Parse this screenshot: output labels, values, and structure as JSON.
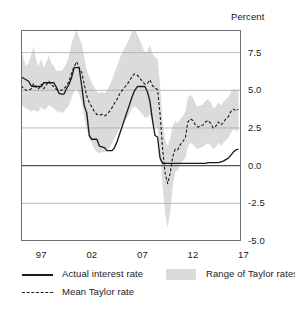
{
  "axis_title": "Percent",
  "legend": {
    "actual_label": "Actual interest rate",
    "mean_label": "Mean Taylor rate",
    "range_label": "Range of Taylor rates"
  },
  "colors": {
    "line": "#1a1a1a",
    "band": "#dbdbdb",
    "grid": "#aaaaaa",
    "zero_line": "#555555",
    "frame": "#6f6f6f"
  },
  "chart_data": {
    "type": "line",
    "title": "",
    "subtitle": "",
    "xlabel": "",
    "ylabel": "Percent",
    "xlim": [
      1995.0,
      2016.75
    ],
    "ylim": [
      -5.0,
      9.0
    ],
    "yticks": [
      7.5,
      5.0,
      2.5,
      0.0,
      -2.5,
      -5.0
    ],
    "ytick_labels": [
      "7.5",
      "5.0",
      "2.5",
      "0.0",
      "-2.5",
      "-5.0"
    ],
    "xticks": [
      1997,
      2002,
      2007,
      2012,
      2017
    ],
    "xtick_labels": [
      "97",
      "02",
      "07",
      "12",
      "17"
    ],
    "x_minor_ticks": [
      1996,
      1998,
      1999,
      2000,
      2001,
      2003,
      2004,
      2005,
      2006,
      2008,
      2009,
      2010,
      2011,
      2013,
      2014,
      2015,
      2016
    ],
    "grid": true,
    "grid_axis": "y",
    "zero_line": true,
    "legend_position": "below",
    "x": [
      1995.0,
      1995.25,
      1995.5,
      1995.75,
      1996.0,
      1996.25,
      1996.5,
      1996.75,
      1997.0,
      1997.25,
      1997.5,
      1997.75,
      1998.0,
      1998.25,
      1998.5,
      1998.75,
      1999.0,
      1999.25,
      1999.5,
      1999.75,
      2000.0,
      2000.25,
      2000.5,
      2000.75,
      2001.0,
      2001.25,
      2001.5,
      2001.75,
      2002.0,
      2002.25,
      2002.5,
      2002.75,
      2003.0,
      2003.25,
      2003.5,
      2003.75,
      2004.0,
      2004.25,
      2004.5,
      2004.75,
      2005.0,
      2005.25,
      2005.5,
      2005.75,
      2006.0,
      2006.25,
      2006.5,
      2006.75,
      2007.0,
      2007.25,
      2007.5,
      2007.75,
      2008.0,
      2008.25,
      2008.5,
      2008.75,
      2009.0,
      2009.25,
      2009.5,
      2009.75,
      2010.0,
      2010.25,
      2010.5,
      2010.75,
      2011.0,
      2011.25,
      2011.5,
      2011.75,
      2012.0,
      2012.25,
      2012.5,
      2012.75,
      2013.0,
      2013.25,
      2013.5,
      2013.75,
      2014.0,
      2014.25,
      2014.5,
      2014.75,
      2015.0,
      2015.25,
      2015.5,
      2015.75,
      2016.0,
      2016.25,
      2016.5
    ],
    "series": [
      {
        "name": "Actual interest rate",
        "style": "solid",
        "values": [
          5.9,
          5.8,
          5.7,
          5.6,
          5.3,
          5.25,
          5.25,
          5.25,
          5.25,
          5.5,
          5.5,
          5.5,
          5.5,
          5.5,
          5.2,
          4.8,
          4.75,
          4.75,
          5.1,
          5.4,
          5.85,
          6.5,
          6.5,
          6.5,
          5.3,
          4.0,
          3.5,
          2.0,
          1.75,
          1.75,
          1.75,
          1.3,
          1.25,
          1.2,
          1.0,
          1.0,
          1.0,
          1.2,
          1.6,
          2.1,
          2.6,
          3.1,
          3.6,
          4.1,
          4.6,
          5.0,
          5.25,
          5.25,
          5.25,
          5.25,
          4.9,
          4.25,
          3.0,
          2.0,
          1.9,
          0.5,
          0.15,
          0.15,
          0.15,
          0.15,
          0.15,
          0.15,
          0.15,
          0.15,
          0.15,
          0.15,
          0.15,
          0.15,
          0.15,
          0.15,
          0.15,
          0.15,
          0.15,
          0.15,
          0.2,
          0.2,
          0.2,
          0.2,
          0.2,
          0.25,
          0.3,
          0.4,
          0.5,
          0.7,
          0.9,
          1.05,
          1.1
        ],
        "description": "Federal funds rate path: near 5.25 in mid 1990s, peak 6.5 in 2000, trough 1.0 in 2003-04, peak 5.25 in 2006-07, near zero 2009-2015, rising to about 1.1 by 2016"
      },
      {
        "name": "Mean Taylor rate",
        "style": "dashed",
        "values": [
          5.3,
          5.15,
          5.0,
          5.0,
          5.1,
          5.45,
          5.2,
          5.1,
          5.4,
          5.1,
          5.35,
          5.6,
          5.35,
          5.25,
          5.05,
          5.0,
          5.0,
          5.1,
          5.3,
          5.6,
          6.15,
          6.55,
          6.9,
          6.5,
          6.2,
          5.4,
          4.6,
          4.2,
          3.9,
          3.6,
          3.4,
          3.35,
          3.4,
          3.3,
          3.4,
          3.6,
          3.85,
          4.15,
          4.4,
          4.75,
          5.0,
          5.2,
          5.4,
          5.65,
          5.95,
          6.1,
          6.0,
          5.8,
          5.6,
          5.4,
          5.45,
          5.7,
          5.3,
          5.15,
          5.05,
          3.4,
          1.1,
          -0.5,
          -1.2,
          -0.5,
          0.6,
          1.1,
          1.05,
          1.4,
          1.6,
          1.85,
          2.9,
          3.1,
          3.0,
          2.7,
          2.55,
          2.65,
          2.7,
          2.9,
          3.0,
          2.8,
          2.5,
          2.6,
          2.9,
          2.7,
          2.85,
          3.1,
          3.25,
          3.6,
          3.75,
          3.65,
          3.75
        ],
        "description": "Mean of Taylor rule prescriptions; peaks near 6.9 in 2000 and 6.1 in 2006, dips to about -1.2 in late 2009, recovering to about 3.75 by 2016"
      }
    ],
    "band": {
      "name": "Range of Taylor rates",
      "type": "range",
      "lower": [
        4.1,
        3.9,
        3.8,
        3.7,
        3.6,
        3.7,
        3.6,
        3.6,
        3.9,
        3.7,
        3.8,
        4.0,
        3.9,
        3.8,
        3.6,
        3.6,
        3.5,
        3.6,
        3.8,
        4.0,
        4.5,
        4.9,
        5.1,
        4.7,
        4.2,
        3.2,
        2.4,
        1.8,
        1.5,
        1.1,
        0.9,
        0.8,
        0.9,
        0.85,
        0.95,
        1.15,
        1.5,
        1.8,
        2.1,
        2.5,
        2.8,
        3.0,
        3.2,
        3.5,
        3.8,
        3.9,
        3.8,
        3.6,
        3.4,
        3.2,
        3.2,
        3.4,
        2.9,
        2.6,
        2.5,
        0.9,
        -1.3,
        -3.2,
        -4.1,
        -3.1,
        -1.4,
        -0.4,
        -0.3,
        0.1,
        0.3,
        0.5,
        1.3,
        1.5,
        1.4,
        1.2,
        1.1,
        1.2,
        1.25,
        1.4,
        1.5,
        1.35,
        1.1,
        1.2,
        1.5,
        1.3,
        1.5,
        1.7,
        1.85,
        2.2,
        2.4,
        2.3,
        2.4
      ],
      "upper": [
        7.9,
        7.1,
        6.6,
        6.8,
        7.3,
        7.9,
        7.0,
        6.6,
        7.1,
        6.5,
        6.9,
        7.3,
        6.8,
        6.6,
        6.3,
        6.3,
        6.3,
        6.5,
        6.8,
        7.3,
        8.1,
        8.6,
        9.0,
        8.5,
        8.1,
        7.2,
        6.3,
        5.9,
        5.5,
        5.2,
        4.9,
        4.8,
        4.9,
        4.8,
        5.0,
        5.3,
        5.7,
        6.2,
        6.6,
        7.1,
        7.5,
        7.8,
        8.1,
        8.5,
        8.9,
        9.0,
        8.7,
        8.3,
        7.9,
        7.5,
        7.6,
        8.0,
        7.4,
        7.2,
        7.1,
        5.3,
        3.0,
        1.7,
        1.3,
        1.8,
        2.6,
        3.0,
        2.8,
        3.1,
        3.3,
        3.6,
        4.5,
        4.7,
        4.5,
        4.1,
        3.9,
        4.0,
        4.05,
        4.3,
        4.4,
        4.2,
        3.8,
        3.9,
        4.2,
        4.0,
        4.2,
        4.4,
        4.55,
        4.9,
        5.1,
        5.0,
        5.1
      ],
      "description": "Shaded gray band spanning the range of alternative Taylor rule prescriptions; widest in the mid 2000s (roughly 3.5 to 9) and plunging to about -4 in 2009"
    }
  }
}
